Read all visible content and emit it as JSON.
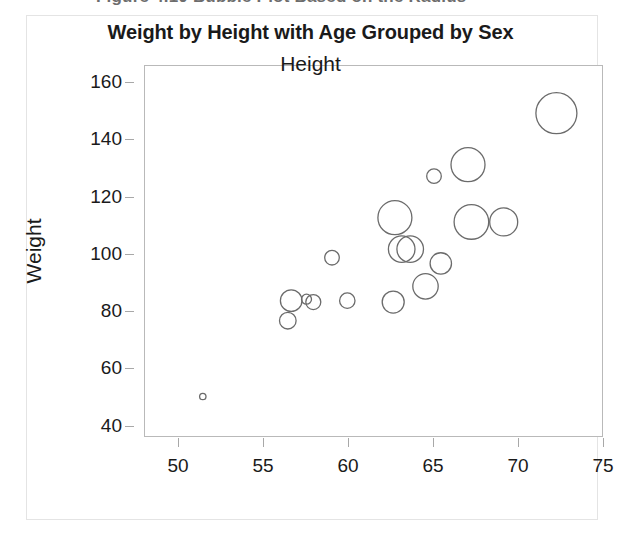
{
  "caption": {
    "text": "Figure 4.10  Bubble Plot Based on the Radius",
    "truncated": true
  },
  "chart_data": {
    "type": "scatter",
    "subtype": "bubble",
    "title": "Weight by Height with Age Grouped by Sex",
    "xlabel": "Height",
    "ylabel": "Weight",
    "xlim": [
      48.0,
      75.0
    ],
    "ylim": [
      36.0,
      166.0
    ],
    "xticks": [
      50,
      55,
      60,
      65,
      70,
      75
    ],
    "yticks": [
      40,
      60,
      80,
      100,
      120,
      140,
      160
    ],
    "grid": false,
    "legend": "none",
    "marker_style": "open-circle",
    "marker_color": "#6b6b6b",
    "marker_fill": "none",
    "size_variable": "Age (radius)",
    "group_variable": "Sex",
    "points": [
      {
        "height": 51.4,
        "weight": 50.5,
        "radius_px": 3.2
      },
      {
        "height": 56.4,
        "weight": 77.0,
        "radius_px": 8.3
      },
      {
        "height": 56.6,
        "weight": 84.0,
        "radius_px": 10.8
      },
      {
        "height": 57.5,
        "weight": 84.5,
        "radius_px": 5.0
      },
      {
        "height": 57.9,
        "weight": 83.5,
        "radius_px": 7.5
      },
      {
        "height": 59.0,
        "weight": 99.0,
        "radius_px": 7.3
      },
      {
        "height": 59.9,
        "weight": 84.0,
        "radius_px": 7.7
      },
      {
        "height": 62.6,
        "weight": 83.5,
        "radius_px": 11.0
      },
      {
        "height": 62.7,
        "weight": 113.0,
        "radius_px": 17.0
      },
      {
        "height": 63.1,
        "weight": 102.0,
        "radius_px": 13.3
      },
      {
        "height": 63.6,
        "weight": 102.0,
        "radius_px": 13.3
      },
      {
        "height": 64.5,
        "weight": 89.0,
        "radius_px": 12.7
      },
      {
        "height": 65.0,
        "weight": 127.5,
        "radius_px": 7.3
      },
      {
        "height": 65.4,
        "weight": 97.0,
        "radius_px": 10.7
      },
      {
        "height": 67.0,
        "weight": 131.5,
        "radius_px": 17.0
      },
      {
        "height": 67.2,
        "weight": 111.5,
        "radius_px": 17.3
      },
      {
        "height": 69.1,
        "weight": 111.5,
        "radius_px": 14.0
      },
      {
        "height": 72.2,
        "weight": 149.5,
        "radius_px": 20.5
      }
    ]
  },
  "colors": {
    "axis_line": "#b9b9b9",
    "tick": "#a8a8a8",
    "text": "#1a1a1a",
    "marker_stroke": "#6b6b6b",
    "figure_border": "#e4e4e4",
    "caption_text": "#6d6d6d"
  }
}
